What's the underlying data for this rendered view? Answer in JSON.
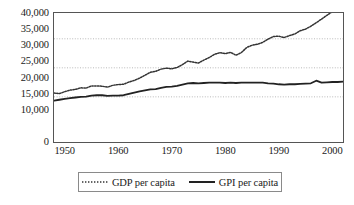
{
  "chart_data": {
    "type": "line",
    "title": "",
    "subtitle": "",
    "xlabel": "",
    "ylabel": "",
    "xlim": [
      1948,
      2002
    ],
    "ylim": [
      0,
      40000
    ],
    "grid": true,
    "grid_values": [
      14000,
      23000,
      32000
    ],
    "legend_position": "bottom-center",
    "y_ticks": [
      {
        "value": 40000,
        "label": "40,000"
      },
      {
        "value": 35000,
        "label": "35,000"
      },
      {
        "value": 30000,
        "label": "30,000"
      },
      {
        "value": 25000,
        "label": "25,000"
      },
      {
        "value": 20000,
        "label": "20,000"
      },
      {
        "value": 15000,
        "label": "15,000"
      },
      {
        "value": 10000,
        "label": "10,000"
      },
      {
        "value": 0,
        "label": "0"
      }
    ],
    "x_ticks": [
      {
        "value": 1950,
        "label": "1950"
      },
      {
        "value": 1960,
        "label": "1960"
      },
      {
        "value": 1970,
        "label": "1970"
      },
      {
        "value": 1980,
        "label": "1980"
      },
      {
        "value": 1990,
        "label": "1990"
      },
      {
        "value": 2000,
        "label": "2000"
      }
    ],
    "x": [
      1948,
      1949,
      1950,
      1951,
      1952,
      1953,
      1954,
      1955,
      1956,
      1957,
      1958,
      1959,
      1960,
      1961,
      1962,
      1963,
      1964,
      1965,
      1966,
      1967,
      1968,
      1969,
      1970,
      1971,
      1972,
      1973,
      1974,
      1975,
      1976,
      1977,
      1978,
      1979,
      1980,
      1981,
      1982,
      1983,
      1984,
      1985,
      1986,
      1987,
      1988,
      1989,
      1990,
      1991,
      1992,
      1993,
      1994,
      1995,
      1996,
      1997,
      1998,
      1999,
      2000,
      2001,
      2002
    ],
    "series": [
      {
        "name": "GDP per capita",
        "style": "dotted",
        "color": "#333333",
        "values": [
          15200,
          15000,
          15600,
          16100,
          16300,
          16800,
          16700,
          17400,
          17400,
          17300,
          17000,
          17600,
          17800,
          17900,
          18600,
          19100,
          19800,
          20700,
          21600,
          21900,
          22600,
          22900,
          22700,
          23100,
          24000,
          25100,
          24800,
          24500,
          25400,
          26200,
          27200,
          27700,
          27400,
          27800,
          26900,
          27700,
          29300,
          30000,
          30300,
          30900,
          31900,
          32700,
          32800,
          32400,
          33000,
          33500,
          34500,
          35000,
          35900,
          37000,
          38100,
          39300,
          40400,
          40300,
          40600
        ]
      },
      {
        "name": "GPI per capita",
        "style": "solid",
        "color": "#222222",
        "values": [
          12800,
          13100,
          13400,
          13600,
          13800,
          14000,
          14100,
          14400,
          14500,
          14500,
          14300,
          14400,
          14400,
          14500,
          14900,
          15300,
          15700,
          16000,
          16300,
          16400,
          16800,
          17100,
          17200,
          17400,
          17800,
          18200,
          18300,
          18200,
          18300,
          18400,
          18400,
          18400,
          18300,
          18400,
          18300,
          18400,
          18400,
          18400,
          18400,
          18400,
          18200,
          18100,
          17900,
          17800,
          17900,
          17900,
          18000,
          18100,
          18200,
          19000,
          18400,
          18500,
          18600,
          18600,
          18700
        ]
      }
    ]
  },
  "legend": {
    "entries": [
      {
        "label": "GDP per capita",
        "marker": "dotted-line-swatch"
      },
      {
        "label": "GPI per capita",
        "marker": "solid-line-swatch"
      }
    ]
  },
  "colors": {
    "gdp_line": "#333333",
    "gpi_line": "#222222",
    "grid": "#b9b9b9",
    "frame": "#555555",
    "legend_border": "#8a8a8a",
    "text": "#1a1a1a",
    "background": "#ffffff"
  }
}
